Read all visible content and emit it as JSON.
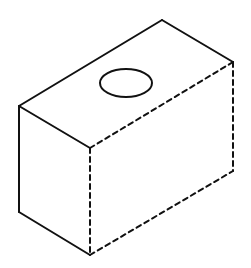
{
  "diagram": {
    "type": "isometric-box-with-hole",
    "stroke_color": "#111111",
    "background": "#ffffff",
    "vertices": {
      "top_left": [
        19,
        106
      ],
      "top_back": [
        162,
        20
      ],
      "top_right": [
        233,
        62
      ],
      "front_top": [
        90,
        148
      ],
      "front_bottom": [
        90,
        255
      ],
      "left_bottom": [
        19,
        212
      ],
      "right_bottom": [
        233,
        171
      ]
    },
    "solid_edges": [
      [
        "top_left",
        "top_back"
      ],
      [
        "top_back",
        "top_right"
      ],
      [
        "top_left",
        "front_top"
      ],
      [
        "top_left",
        "left_bottom"
      ],
      [
        "left_bottom",
        "front_bottom"
      ]
    ],
    "dashed_edges": [
      [
        "top_right",
        "front_top"
      ],
      [
        "top_right",
        "right_bottom"
      ],
      [
        "front_top",
        "front_bottom"
      ],
      [
        "front_bottom",
        "right_bottom"
      ]
    ],
    "hole": {
      "cx": 126,
      "cy": 83,
      "rx": 26,
      "ry": 14
    }
  }
}
